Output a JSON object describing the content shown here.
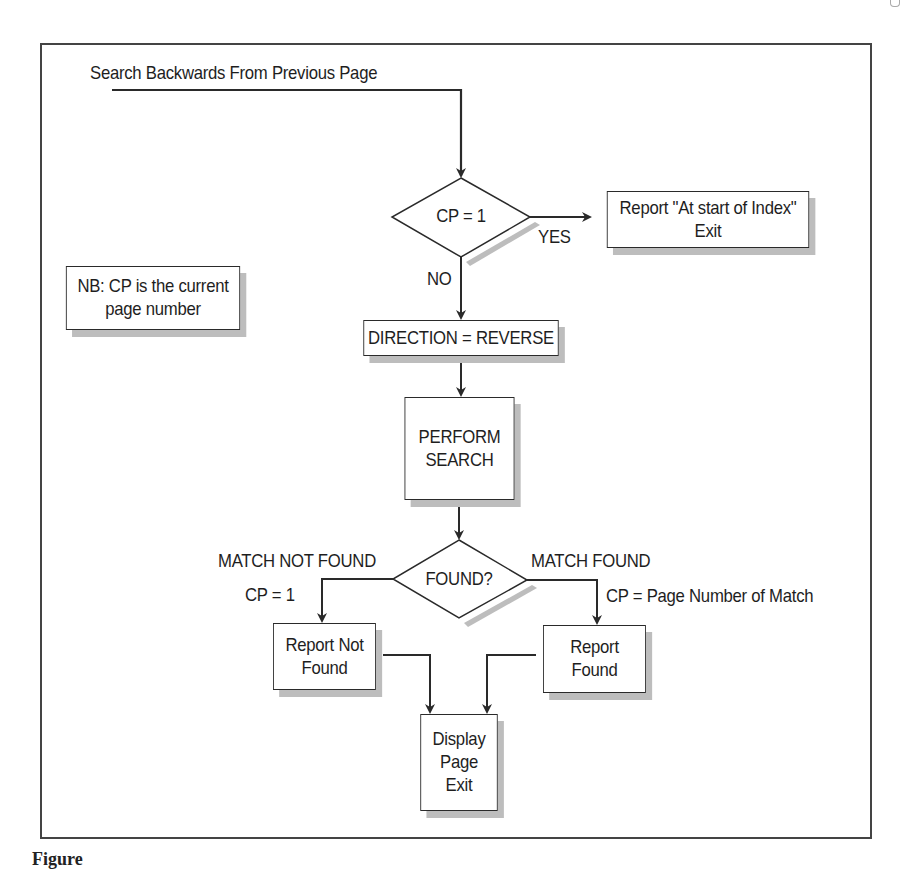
{
  "diagram": {
    "type": "flowchart",
    "entry_label": "Search Backwards From Previous Page",
    "note": {
      "line1": "NB: CP is the current",
      "line2": "page number"
    },
    "decision_cp": {
      "text": "CP = 1",
      "yes_label": "YES",
      "no_label": "NO"
    },
    "box_at_start": {
      "line1": "Report \"At start of Index\"",
      "line2": "Exit"
    },
    "box_direction": {
      "text": "DIRECTION = REVERSE"
    },
    "box_search": {
      "line1": "PERFORM",
      "line2": "SEARCH"
    },
    "decision_found": {
      "text": "FOUND?",
      "left_branch_label": "MATCH NOT FOUND",
      "left_branch_action": "CP = 1",
      "right_branch_label": "MATCH FOUND",
      "right_branch_action": "CP = Page Number of Match"
    },
    "box_not_found": {
      "line1": "Report Not",
      "line2": "Found"
    },
    "box_found": {
      "line1": "Report",
      "line2": "Found"
    },
    "box_display": {
      "line1": "Display",
      "line2": "Page",
      "line3": "Exit"
    },
    "caption": "Figure"
  },
  "colors": {
    "line": "#2a2a2a",
    "shadow": "#bdbdbd",
    "frame": "#444444",
    "background": "#ffffff"
  }
}
